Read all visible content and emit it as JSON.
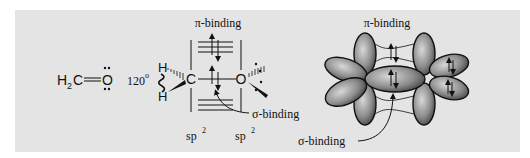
{
  "figure": {
    "lewis_structure": {
      "formula_h": "H",
      "formula_sub": "2",
      "formula_c": "C",
      "formula_o": "O",
      "bond": "double"
    },
    "angle_label": "120",
    "angle_unit": "o",
    "left_diagram": {
      "pi_label": "π-binding",
      "sigma_label": "σ-binding",
      "atoms": {
        "h_top": "H",
        "h_bottom": "H",
        "carbon": "C",
        "oxygen": "O"
      },
      "hybrid_c": "sp",
      "hybrid_c_sup": "2",
      "hybrid_o": "sp",
      "hybrid_o_sup": "2"
    },
    "right_diagram": {
      "pi_label": "π-binding",
      "sigma_label": "σ-binding"
    },
    "colors": {
      "panel_background": "#e4e4e4",
      "orbital_fill_dark": "#5a5a5a",
      "orbital_fill_light": "#c8c8c8",
      "ink": "#111111"
    }
  }
}
